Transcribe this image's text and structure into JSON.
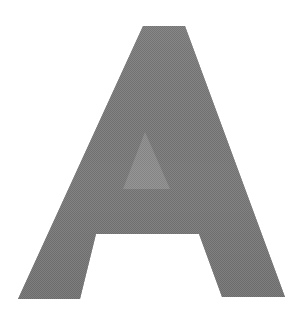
{
  "image": {
    "kind": "letterform-glyph",
    "character": "A",
    "description": "Large uppercase letter A",
    "width": 291,
    "height": 326,
    "background_color": "#ffffff",
    "glyph_color": "#848484",
    "glyph_color_dark": "#6e6e6e",
    "glyph_color_light": "#9c9c9c",
    "texture": "dithered-halftone",
    "style": "bold sans-serif, pointed apex, flat-cut feet, triangular counter"
  },
  "geometry": {
    "apex": [
      143,
      26
    ],
    "outline_points": [
      [
        143,
        26
      ],
      [
        185,
        26
      ],
      [
        285,
        297
      ],
      [
        222,
        297
      ],
      [
        199,
        234
      ],
      [
        96,
        234
      ],
      [
        80,
        299
      ],
      [
        18,
        299
      ]
    ],
    "counter_points": [
      [
        145,
        132
      ],
      [
        170,
        189
      ],
      [
        123,
        189
      ]
    ],
    "crossbar_baseline_y": 234,
    "counter_baseline_y": 189,
    "foot_left_span": [
      18,
      83
    ],
    "foot_right_span": [
      222,
      285
    ]
  }
}
